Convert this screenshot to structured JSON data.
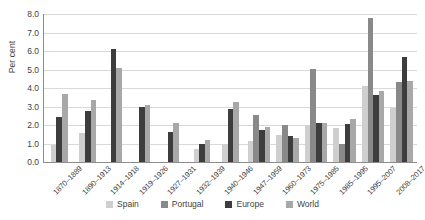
{
  "chart_data": {
    "type": "bar",
    "title": "",
    "xlabel": "",
    "ylabel": "Per cent",
    "ylim": [
      0,
      8
    ],
    "ytick_step": 1,
    "grid": true,
    "legend_position": "bottom",
    "categories": [
      "1870–1889",
      "1890–1913",
      "1914–1918",
      "1919–1926",
      "1927–1931",
      "1932–1939",
      "1940–1946",
      "1947–1959",
      "1960–1973",
      "1975–1985",
      "1985–1995",
      "1995–2007",
      "2008–2017"
    ],
    "ytick_labels": [
      "0.0",
      "1.0",
      "2.0",
      "3.0",
      "4.0",
      "5.0",
      "6.0",
      "7.0",
      "8.0"
    ],
    "series": [
      {
        "name": "Spain",
        "color": "#cfcfcf",
        "values": [
          0.9,
          1.55,
          null,
          null,
          null,
          0.7,
          1.0,
          1.15,
          1.45,
          2.0,
          1.85,
          4.1,
          2.9
        ]
      },
      {
        "name": "Portugal",
        "color": "#898989",
        "values": [
          null,
          null,
          null,
          null,
          null,
          null,
          null,
          2.55,
          2.0,
          5.05,
          0.95,
          7.8,
          4.3
        ]
      },
      {
        "name": "Europe",
        "color": "#3d3d3d",
        "values": [
          2.45,
          2.75,
          6.1,
          2.95,
          1.6,
          1.0,
          2.85,
          1.75,
          1.4,
          2.1,
          2.05,
          3.6,
          5.7
        ]
      },
      {
        "name": "World",
        "color": "#a8a8a8",
        "values": [
          3.7,
          3.35,
          5.1,
          3.1,
          2.1,
          1.2,
          3.25,
          1.9,
          1.3,
          2.1,
          2.3,
          3.85,
          4.4
        ]
      }
    ]
  }
}
